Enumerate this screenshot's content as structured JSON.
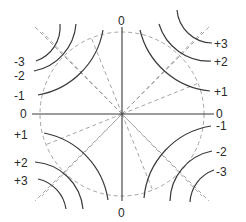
{
  "diagram": {
    "axis_labels": {
      "top": "0",
      "bottom": "0",
      "left": "0",
      "right": "0"
    },
    "quadrants": {
      "top_left": {
        "labels": [
          "-3",
          "-2",
          "-1"
        ]
      },
      "top_right": {
        "labels": [
          "+3",
          "+2",
          "+1"
        ]
      },
      "bottom_left": {
        "labels": [
          "+1",
          "+2",
          "+3"
        ]
      },
      "bottom_right": {
        "labels": [
          "-1",
          "-2",
          "-3"
        ]
      }
    },
    "colors": {
      "equipotential": "#3a3a3a",
      "field_lines": "#9a9a9a",
      "background": "#ffffff"
    }
  }
}
